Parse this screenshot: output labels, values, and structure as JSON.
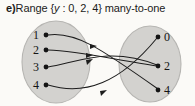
{
  "caption": {
    "item_label": "e)",
    "text_before": "Range {",
    "var": "y",
    "text_after": " : 0, 2, 4} many-to-one",
    "full": "e) Range {y : 0, 2, 4} many-to-one"
  },
  "colors": {
    "ellipse_fill": "#d3d2cf",
    "ellipse_stroke": "#b4b3b0",
    "arrow": "#1d1d1d",
    "node_dot": "#141414",
    "text": "#141414",
    "background": "#fbfaf7"
  },
  "diagram": {
    "type": "mapping-diagram",
    "relation": "many-to-one",
    "domain_set": {
      "name": "domain",
      "nodes": [
        {
          "label": "1",
          "cx": 45,
          "cy": 35
        },
        {
          "label": "2",
          "cx": 45,
          "cy": 50
        },
        {
          "label": "3",
          "cx": 45,
          "cy": 67
        },
        {
          "label": "4",
          "cx": 45,
          "cy": 85
        }
      ]
    },
    "range_set": {
      "name": "range",
      "values": [
        "0",
        "2",
        "4"
      ],
      "nodes": [
        {
          "label": "0",
          "cx": 160,
          "cy": 37
        },
        {
          "label": "2",
          "cx": 160,
          "cy": 66
        },
        {
          "label": "4",
          "cx": 160,
          "cy": 90
        }
      ]
    },
    "mappings": [
      {
        "from": "1",
        "to": "4"
      },
      {
        "from": "2",
        "to": "2"
      },
      {
        "from": "3",
        "to": "2"
      },
      {
        "from": "4",
        "to": "0"
      }
    ]
  }
}
